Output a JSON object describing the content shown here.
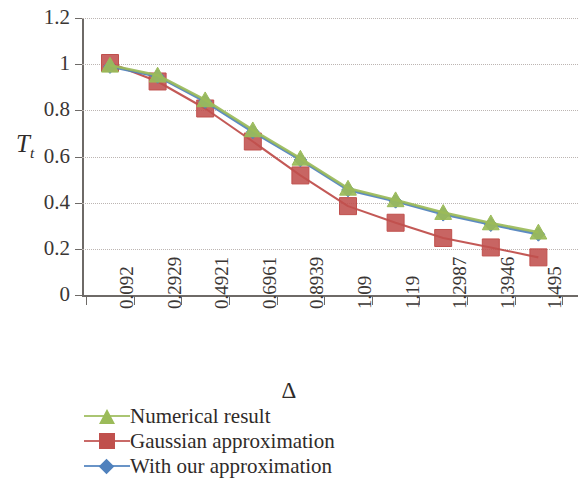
{
  "chart_data": {
    "type": "line",
    "title": "",
    "xlabel": "Δ",
    "ylabel": "T_t",
    "ylabel_base": "T",
    "ylabel_sub": "t",
    "categories": [
      "0.092",
      "0.2929",
      "0.4921",
      "0.6961",
      "0.8939",
      "1.09",
      "1.19",
      "1.2987",
      "1.3946",
      "1.495"
    ],
    "ylim": [
      0,
      1.2
    ],
    "ytick_labels": [
      "0",
      "0.2",
      "0.4",
      "0.6",
      "0.8",
      "1",
      "1.2"
    ],
    "ytick_values": [
      0,
      0.2,
      0.4,
      0.6,
      0.8,
      1,
      1.2
    ],
    "grid": "horizontal-dotted",
    "legend_position": "below",
    "series": [
      {
        "name": "Numerical result",
        "color": "#9BBB59",
        "marker": "triangle",
        "values": [
          0.995,
          0.952,
          0.845,
          0.715,
          0.592,
          0.462,
          0.412,
          0.357,
          0.312,
          0.272
        ]
      },
      {
        "name": "Gaussian approximation",
        "color": "#C0504D",
        "marker": "square",
        "values": [
          1.005,
          0.925,
          0.808,
          0.665,
          0.518,
          0.385,
          0.313,
          0.247,
          0.206,
          0.163
        ]
      },
      {
        "name": "With our approximation",
        "color": "#4F81BD",
        "marker": "diamond",
        "values": [
          0.99,
          0.947,
          0.838,
          0.707,
          0.585,
          0.455,
          0.406,
          0.35,
          0.305,
          0.263
        ]
      }
    ]
  },
  "legend": {
    "items": [
      {
        "label": "Numerical result",
        "color": "#9BBB59",
        "marker": "triangle"
      },
      {
        "label": "Gaussian approximation",
        "color": "#C0504D",
        "marker": "square"
      },
      {
        "label": "With our approximation",
        "color": "#4F81BD",
        "marker": "diamond"
      }
    ]
  },
  "axes": {
    "x_title": "Δ",
    "y_title_base": "T",
    "y_title_sub": "t"
  }
}
